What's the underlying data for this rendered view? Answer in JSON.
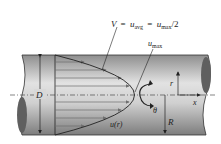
{
  "diagram": {
    "labels": {
      "average_velocity": {
        "V": "V",
        "eq1": "=",
        "u1": "u",
        "sub1": "avg",
        "eq2": "=",
        "u2": "u",
        "sub2": "max",
        "tail": "/2"
      },
      "umax": {
        "u": "u",
        "sub": "max"
      },
      "diameter": "D",
      "radius_axis": "r",
      "x_axis": "x",
      "theta": "θ",
      "radius": "R",
      "profile": "u(r)"
    },
    "colors": {
      "pipe_light": "#d9d9d9",
      "pipe_dark": "#8e8e8e",
      "end_cap": "#5f5f5f",
      "arrows": "#6f6f6f",
      "lines": "#222222"
    }
  }
}
